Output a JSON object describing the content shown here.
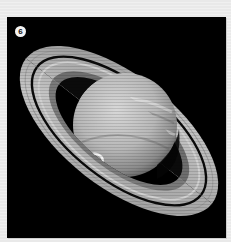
{
  "figure": {
    "number_badge": "6",
    "colors": {
      "page_background": "#ebebeb",
      "photo_background": "#000000",
      "planet_light": "#c9c9c9",
      "ring_light": "#bdbdbd",
      "aurora": "#f2f2f2",
      "badge_fill": "#f4f4f4",
      "badge_text": "#111111"
    }
  }
}
